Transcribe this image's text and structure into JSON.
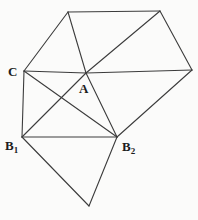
{
  "figure": {
    "background": "#fbfbfa",
    "stroke_color": "#3c3c3c",
    "stroke_width": 1.1,
    "vertices": {
      "TL": {
        "x": 68,
        "y": 12
      },
      "TR": {
        "x": 160,
        "y": 11
      },
      "R": {
        "x": 192,
        "y": 70
      },
      "C": {
        "x": 24,
        "y": 71
      },
      "A": {
        "x": 86,
        "y": 73
      },
      "B1": {
        "x": 22,
        "y": 137
      },
      "B2": {
        "x": 117,
        "y": 137
      },
      "BOT": {
        "x": 89,
        "y": 206
      }
    },
    "edges": [
      [
        "TL",
        "TR"
      ],
      [
        "TL",
        "C"
      ],
      [
        "TL",
        "A"
      ],
      [
        "TR",
        "A"
      ],
      [
        "TR",
        "R"
      ],
      [
        "C",
        "A"
      ],
      [
        "A",
        "R"
      ],
      [
        "C",
        "B1"
      ],
      [
        "C",
        "B2"
      ],
      [
        "B1",
        "A"
      ],
      [
        "A",
        "B2"
      ],
      [
        "B1",
        "B2"
      ],
      [
        "R",
        "B2"
      ],
      [
        "B1",
        "BOT"
      ],
      [
        "B2",
        "BOT"
      ]
    ],
    "labels": [
      {
        "id": "C",
        "text": "C",
        "sub": "",
        "x": 8,
        "y": 76
      },
      {
        "id": "A",
        "text": "A",
        "sub": "",
        "x": 79,
        "y": 93
      },
      {
        "id": "B1",
        "text": "B",
        "sub": "1",
        "x": 5,
        "y": 150
      },
      {
        "id": "B2",
        "text": "B",
        "sub": "2",
        "x": 122,
        "y": 151
      }
    ]
  }
}
